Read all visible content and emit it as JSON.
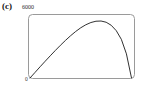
{
  "figure": {
    "panel_label": "(c)",
    "y_max_label": "6000",
    "origin_label": "0"
  },
  "colors": {
    "curve": "#1a1a1a",
    "frame": "#9a9a9a",
    "background": "#ffffff",
    "text": "#111111"
  },
  "chart_data": {
    "type": "line",
    "title": "",
    "xlabel": "",
    "ylabel": "",
    "ylim": [
      0,
      6000
    ],
    "xlim": [
      0,
      1
    ],
    "grid": false,
    "legend": false,
    "tick_labels": {
      "y": [
        "0",
        "6000"
      ],
      "x": []
    },
    "series": [
      {
        "name": "curve",
        "x": [
          0.0,
          0.05,
          0.1,
          0.15,
          0.2,
          0.25,
          0.3,
          0.35,
          0.4,
          0.45,
          0.5,
          0.55,
          0.6,
          0.65,
          0.7,
          0.75,
          0.8,
          0.85,
          0.9,
          0.95,
          1.0
        ],
        "y": [
          0,
          560,
          1120,
          1670,
          2210,
          2740,
          3250,
          3740,
          4200,
          4620,
          4990,
          5290,
          5510,
          5640,
          5660,
          5540,
          5240,
          4700,
          3840,
          2400,
          0
        ]
      }
    ]
  }
}
